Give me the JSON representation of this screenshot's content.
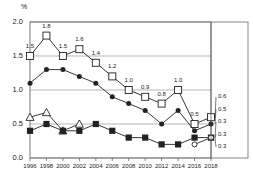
{
  "chart_data": {
    "type": "line",
    "title": "",
    "subtitle": "",
    "xlabel": "",
    "ylabel": "",
    "unit_label": "%",
    "categories": [
      "1996",
      "1998",
      "2000",
      "2002",
      "2004",
      "2006",
      "2008",
      "2010",
      "2012",
      "2014",
      "2016",
      "2018"
    ],
    "x": [
      1996,
      1998,
      2000,
      2002,
      2004,
      2006,
      2008,
      2010,
      2012,
      2014,
      2016,
      2018
    ],
    "ylim": [
      0.0,
      2.0
    ],
    "yticks": [
      "0.0",
      "0.5",
      "1.0",
      "1.5",
      "2.0"
    ],
    "ytick_values": [
      0.0,
      0.5,
      1.0,
      1.5,
      2.0
    ],
    "grid": true,
    "legend": "none",
    "series": [
      {
        "name": "open-square-series",
        "marker": "open-square",
        "values": [
          1.5,
          1.8,
          1.5,
          1.6,
          1.4,
          1.2,
          1.0,
          0.9,
          0.8,
          1.0,
          0.5,
          0.6
        ],
        "labels": [
          "1.5",
          "1.8",
          "1.5",
          "1.6",
          "1.4",
          "1.2",
          "1.0",
          "0.9",
          "0.8",
          "1.0",
          "0.5",
          ""
        ]
      },
      {
        "name": "filled-circle-series",
        "marker": "filled-circle",
        "values": [
          1.1,
          1.3,
          1.3,
          1.2,
          1.1,
          0.9,
          0.8,
          0.7,
          0.5,
          0.7,
          0.4,
          0.5
        ],
        "labels": [
          "",
          "",
          "",
          "",
          "",
          "",
          "",
          "",
          "",
          "",
          "",
          ""
        ]
      },
      {
        "name": "triangle-series",
        "marker": "open-triangle",
        "values": [
          0.6,
          0.67,
          0.4,
          0.5,
          null,
          null,
          null,
          null,
          null,
          null,
          null,
          null
        ],
        "labels": [
          "",
          "",
          "",
          "",
          "",
          "",
          "",
          "",
          "",
          "",
          "",
          ""
        ]
      },
      {
        "name": "filled-square-series",
        "marker": "filled-square",
        "values": [
          0.4,
          0.5,
          0.4,
          0.4,
          0.5,
          0.4,
          0.3,
          0.3,
          0.2,
          0.2,
          0.3,
          0.3
        ],
        "labels": [
          "",
          "",
          "",
          "",
          "",
          "",
          "",
          "",
          "",
          "",
          "",
          ""
        ]
      },
      {
        "name": "open-circle-series",
        "marker": "open-circle",
        "values": [
          null,
          null,
          null,
          null,
          null,
          null,
          null,
          null,
          null,
          null,
          0.2,
          0.3
        ],
        "labels": [
          "",
          "",
          "",
          "",
          "",
          "",
          "",
          "",
          "",
          "",
          "",
          ""
        ]
      }
    ],
    "end_callouts": [
      "0.6",
      "0.5",
      "0.3",
      "0.3",
      "0.3"
    ],
    "annotations": []
  },
  "axis": {
    "unit": "%",
    "y_labels": [
      "2.0",
      "1.5",
      "1.0",
      "0.5",
      "0.0"
    ],
    "x_labels": [
      "1996",
      "1998",
      "2000",
      "2002",
      "2004",
      "2006",
      "2008",
      "2010",
      "2012",
      "2014",
      "2016",
      "2018"
    ]
  },
  "colors": {
    "line": "#222222",
    "grid": "#888888",
    "axis": "#555555",
    "background": "#ffffff"
  }
}
